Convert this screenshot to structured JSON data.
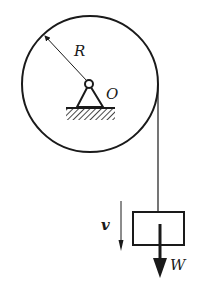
{
  "diagram": {
    "type": "pulley-with-hanging-block",
    "labels": {
      "radius": "R",
      "center": "O",
      "velocity": "v",
      "weight": "W"
    },
    "colors": {
      "stroke": "#1a1a1a",
      "background": "#ffffff"
    }
  }
}
